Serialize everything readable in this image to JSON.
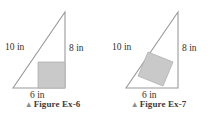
{
  "page": {
    "background_color": "#ffffff",
    "figure_count": 2
  },
  "style": {
    "stroke_color": "#9a9a9a",
    "shade_fill": "#c9c9c9",
    "shade_stroke": "#b0b0b0",
    "label_color": "#2f2f2f",
    "caption_color": "#3b3b3b",
    "marker_color": "#8e8e8e"
  },
  "figures": [
    {
      "id": "figure-ex-6",
      "caption_marker": "▲",
      "caption": "Figure Ex-6",
      "shape": "right-triangle-with-inscribed-rectangle",
      "labels": {
        "hypotenuse": "10 in",
        "vertical_leg": "8 in",
        "horizontal_leg": "6 in"
      },
      "geometry": {
        "triangle_points": "13,88 65,88 65,12",
        "shaded_points": "38,62 65,62 65,88 38,88",
        "hypotenuse_label_pos": {
          "x": 5,
          "y": 50
        },
        "vertical_label_pos": {
          "x": 69,
          "y": 51
        },
        "horizontal_label_pos": {
          "x": 30,
          "y": 98
        }
      }
    },
    {
      "id": "figure-ex-7",
      "caption_marker": "▲",
      "caption": "Figure Ex-7",
      "shape": "right-triangle-with-inscribed-tilted-square",
      "labels": {
        "hypotenuse": "10 in",
        "vertical_leg": "8 in",
        "horizontal_leg": "6 in"
      },
      "geometry": {
        "triangle_points": "20,88 72,88 72,12",
        "shaded_points": "42,52 67,62 57,86 32,76",
        "hypotenuse_label_pos": {
          "x": 6,
          "y": 50
        },
        "vertical_label_pos": {
          "x": 76,
          "y": 51
        },
        "horizontal_label_pos": {
          "x": 36,
          "y": 98
        }
      }
    }
  ]
}
